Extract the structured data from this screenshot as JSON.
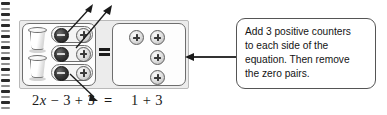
{
  "page": {
    "kind": "math-manipulative-diagram",
    "background_color": "#ffffff"
  },
  "binding": {
    "name": "spiral-binding",
    "coil_count": 19,
    "color": "#2c2c2c"
  },
  "balance": {
    "label": "equation-balance-model",
    "tray_color": "#ececec",
    "equals_sign": "=",
    "left_panel": {
      "label": "left-side-model",
      "cups": [
        {
          "label": "cup-1",
          "meaning": "x"
        },
        {
          "label": "cup-2",
          "meaning": "x"
        }
      ],
      "counter_pairs": [
        {
          "label": "zero-pair-1",
          "negative": "−",
          "positive": "+"
        },
        {
          "label": "zero-pair-2",
          "negative": "−",
          "positive": "+"
        },
        {
          "label": "zero-pair-3",
          "negative": "−",
          "positive": "+"
        }
      ]
    },
    "right_panel": {
      "label": "right-side-model",
      "positive_counters": [
        {
          "label": "positive-counter-1",
          "glyph": "+"
        },
        {
          "label": "positive-counter-2",
          "glyph": "+"
        },
        {
          "label": "positive-counter-3",
          "glyph": "+"
        },
        {
          "label": "positive-counter-4",
          "glyph": "+"
        }
      ]
    }
  },
  "equation": {
    "left_coefficient": "2",
    "left_variable": "x",
    "left_rest": " − 3 + 3",
    "equals": "=",
    "right": "1 + 3"
  },
  "callout": {
    "name": "instruction-callout",
    "lines": [
      "Add 3 positive counters",
      "to each side of the",
      "equation. Then remove",
      "the zero pairs."
    ],
    "border_color": "#555555"
  },
  "annotations": {
    "pointer_arrows": [
      {
        "label": "arrow-to-added-positive-1",
        "direction": "up-right"
      },
      {
        "label": "arrow-to-added-positive-2",
        "direction": "up-right"
      },
      {
        "label": "arrow-to-added-positive-3",
        "direction": "down-right"
      }
    ],
    "connector": {
      "label": "callout-connector-arrow",
      "direction": "left"
    }
  },
  "colors": {
    "negative_counter": "#1d1d1d",
    "positive_counter": "#e0e0e0",
    "panel_border": "#6e6e6e",
    "ink": "#141414"
  }
}
